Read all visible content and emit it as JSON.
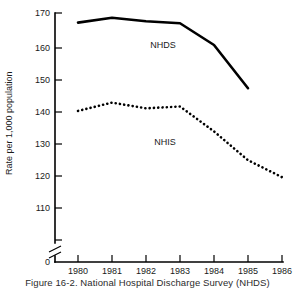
{
  "figure": {
    "caption": "Figure 16-2. National Hospital Discharge Survey (NHDS)"
  },
  "chart_data": {
    "type": "line",
    "title": "",
    "xlabel": "",
    "ylabel": "Rate per 1,000 population",
    "x": [
      1980,
      1981,
      1982,
      1983,
      1984,
      1985,
      1986
    ],
    "xticklabels": [
      "1980",
      "1981",
      "1982",
      "1983",
      "1984",
      "1985",
      "1986"
    ],
    "yticklabels": [
      "0",
      "110",
      "120",
      "130",
      "140",
      "150",
      "160",
      "170"
    ],
    "yticks": [
      0,
      110,
      120,
      130,
      140,
      150,
      160,
      170
    ],
    "ylim": [
      110,
      170
    ],
    "xlim": [
      1980,
      1986
    ],
    "axis_break": true,
    "grid": false,
    "legend": "inline-labels",
    "series": [
      {
        "name": "NHDS",
        "style": "solid",
        "label": "NHDS",
        "x": [
          1980,
          1981,
          1982,
          1983,
          1984,
          1985
        ],
        "values": [
          167.0,
          168.5,
          167.4,
          166.8,
          160.0,
          146.5
        ]
      },
      {
        "name": "NHIS",
        "style": "dotted",
        "label": "NHIS",
        "x": [
          1980,
          1981,
          1982,
          1983,
          1984,
          1985,
          1986
        ],
        "values": [
          139.4,
          142.0,
          140.2,
          140.8,
          133.0,
          124.0,
          118.7
        ]
      }
    ]
  },
  "colors": {
    "ink": "#000000",
    "background": "#ffffff"
  }
}
